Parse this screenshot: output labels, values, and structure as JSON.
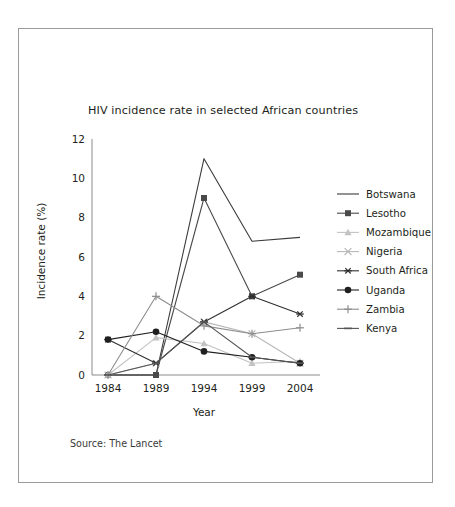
{
  "figure": {
    "title": "HIV incidence rate in selected African countries",
    "source_note": "Source: The Lancet",
    "frame_color": "#9a9a9a",
    "background": "#ffffff"
  },
  "chart_data": {
    "type": "line",
    "title": "HIV incidence rate in selected African countries",
    "xlabel": "Year",
    "ylabel": "Incidence rate (%)",
    "categories": [
      "1984",
      "1989",
      "1994",
      "1999",
      "2004"
    ],
    "x": [
      1984,
      1989,
      1994,
      1999,
      2004
    ],
    "ylim": [
      0,
      12
    ],
    "yticks": [
      0,
      2,
      4,
      6,
      8,
      10,
      12
    ],
    "ytick_labels": [
      "0",
      "2",
      "4",
      "6",
      "8",
      "10",
      "12"
    ],
    "grid": false,
    "legend_position": "right",
    "series": [
      {
        "name": "Botswana",
        "marker": "none",
        "color": "#3b3b3b",
        "values": [
          0,
          0,
          11,
          6.8,
          7
        ]
      },
      {
        "name": "Lesotho",
        "marker": "square",
        "color": "#4a4a4a",
        "values": [
          0,
          0,
          9,
          4,
          5.1
        ]
      },
      {
        "name": "Mozambique",
        "marker": "triangle",
        "color": "#c2c2c2",
        "values": [
          0,
          1.9,
          1.6,
          0.6,
          0.7
        ]
      },
      {
        "name": "Nigeria",
        "marker": "x",
        "color": "#b8b8b8",
        "values": [
          0,
          0.6,
          2.7,
          2.1,
          0.6
        ]
      },
      {
        "name": "South Africa",
        "marker": "asterisk",
        "color": "#2f2f2f",
        "values": [
          1.8,
          0.6,
          2.7,
          4,
          3.1
        ]
      },
      {
        "name": "Uganda",
        "marker": "circle",
        "color": "#1f1f1f",
        "values": [
          1.8,
          2.2,
          1.2,
          0.9,
          0.6
        ]
      },
      {
        "name": "Zambia",
        "marker": "plus",
        "color": "#8e8e8e",
        "values": [
          0,
          4,
          2.5,
          2.1,
          2.4
        ]
      },
      {
        "name": "Kenya",
        "marker": "dash",
        "color": "#555555",
        "values": [
          0,
          0.6,
          2.7,
          0.9,
          0.6
        ]
      }
    ]
  },
  "legend": {
    "entries": [
      {
        "label": "Botswana"
      },
      {
        "label": "Lesotho"
      },
      {
        "label": "Mozambique"
      },
      {
        "label": "Nigeria"
      },
      {
        "label": "South Africa"
      },
      {
        "label": "Uganda"
      },
      {
        "label": "Zambia"
      },
      {
        "label": "Kenya"
      }
    ]
  }
}
